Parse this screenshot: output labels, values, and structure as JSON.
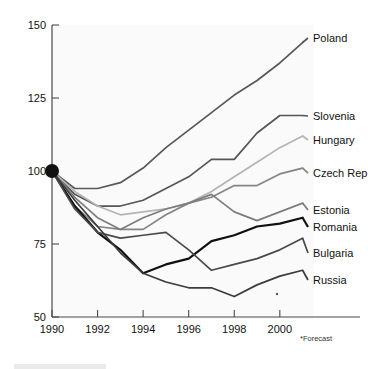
{
  "figure": {
    "background_color": "#ffffff",
    "plot_background_color": "#fafafa",
    "axis_color": "#4a4a4a",
    "footnote": "*Forecast"
  },
  "chart_data": {
    "type": "line",
    "title": "",
    "subtitle": "",
    "xlabel": "",
    "ylabel": "",
    "xlim": [
      1990,
      2001.5
    ],
    "ylim": [
      50,
      150
    ],
    "grid": false,
    "legend_position": "right-inline-labels",
    "xticks": [
      1990,
      1992,
      1994,
      1996,
      1998,
      2000
    ],
    "xtick_labels": [
      "1990",
      "1992",
      "1994",
      "1996",
      "1998",
      "2000"
    ],
    "yticks": [
      50,
      75,
      100,
      125,
      150
    ],
    "ytick_labels": [
      "50",
      "75",
      "100",
      "125",
      "150"
    ],
    "annotations": [
      "*Forecast"
    ],
    "origin_marker": {
      "x": 1990,
      "y": 100,
      "style": "filled-circle",
      "color": "#111111"
    },
    "x": [
      1990,
      1991,
      1992,
      1993,
      1994,
      1995,
      1996,
      1997,
      1998,
      1999,
      2000,
      2001
    ],
    "series": [
      {
        "name": "Poland",
        "color": "#585858",
        "width": 1.7,
        "values": [
          100,
          94,
          94,
          96,
          101,
          108,
          114,
          120,
          126,
          131,
          137,
          144
        ]
      },
      {
        "name": "Slovenia",
        "color": "#555555",
        "width": 1.7,
        "values": [
          100,
          92,
          88,
          88,
          90,
          94,
          98,
          104,
          104,
          113,
          119,
          119
        ]
      },
      {
        "name": "Hungary",
        "color": "#b4b4b4",
        "width": 1.7,
        "values": [
          100,
          93,
          88,
          85,
          86,
          87,
          89,
          93,
          98,
          103,
          108,
          112
        ]
      },
      {
        "name": "Czech Rep",
        "color": "#858585",
        "width": 1.7,
        "values": [
          100,
          88,
          81,
          80,
          80,
          85,
          89,
          91,
          95,
          95,
          99,
          101
        ]
      },
      {
        "name": "Estonia",
        "color": "#7d7d7d",
        "width": 1.7,
        "values": [
          100,
          91,
          84,
          80,
          84,
          87,
          89,
          92,
          86,
          83,
          86,
          89
        ]
      },
      {
        "name": "Romania",
        "color": "#111111",
        "width": 2.2,
        "values": [
          100,
          88,
          79,
          73,
          65,
          68,
          70,
          76,
          78,
          81,
          82,
          84
        ]
      },
      {
        "name": "Bulgaria",
        "color": "#4a4a4a",
        "width": 1.7,
        "values": [
          100,
          87,
          79,
          77,
          78,
          79,
          73,
          66,
          68,
          70,
          73,
          77
        ]
      },
      {
        "name": "Russia",
        "color": "#3c3c3c",
        "width": 1.7,
        "values": [
          100,
          90,
          81,
          72,
          65,
          62,
          60,
          60,
          57,
          61,
          64,
          66
        ]
      }
    ],
    "label_positions": [
      {
        "name": "Poland",
        "x": 313,
        "y": 42
      },
      {
        "name": "Slovenia",
        "x": 313,
        "y": 120
      },
      {
        "name": "Hungary",
        "x": 313,
        "y": 144
      },
      {
        "name": "Czech Rep",
        "x": 313,
        "y": 177
      },
      {
        "name": "Estonia",
        "x": 313,
        "y": 214
      },
      {
        "name": "Romania",
        "x": 313,
        "y": 231
      },
      {
        "name": "Bulgaria",
        "x": 313,
        "y": 257
      },
      {
        "name": "Russia",
        "x": 313,
        "y": 284
      }
    ]
  }
}
